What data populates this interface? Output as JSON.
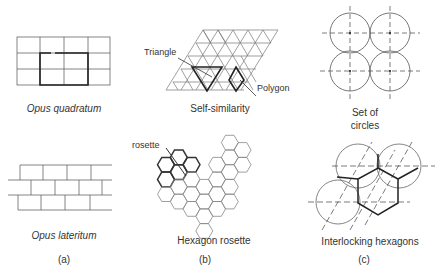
{
  "figure": {
    "panels": [
      {
        "id": "a",
        "label": "(a)",
        "top": {
          "caption": "Opus quadratum",
          "grid": {
            "cols": 4,
            "rows": 3
          }
        },
        "bottom": {
          "caption": "Opus lateritum",
          "courses": 3
        }
      },
      {
        "id": "b",
        "label": "(b)",
        "top": {
          "caption": "Self-similarity",
          "callouts": [
            "Triangle",
            "Polygon"
          ]
        },
        "bottom": {
          "caption": "Hexagon rosette",
          "callouts": [
            "rosette"
          ]
        }
      },
      {
        "id": "c",
        "label": "(c)",
        "top": {
          "caption_line1": "Set of",
          "caption_line2": "circles",
          "circle_count": 4
        },
        "bottom": {
          "caption": "Interlocking hexagons",
          "circle_count": 3
        }
      }
    ]
  },
  "colors": {
    "line": "#555555",
    "bold": "#222222",
    "text": "#333333",
    "background": "#ffffff"
  }
}
